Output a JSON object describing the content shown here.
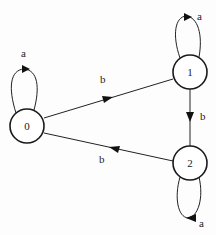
{
  "diagram": {
    "type": "finite-state-automaton",
    "background": "#ffffff",
    "stroke_color": "#1a1a1a",
    "nodes": [
      {
        "id": "0",
        "label": "0",
        "cx": 27,
        "cy": 126,
        "r": 17
      },
      {
        "id": "1",
        "label": "1",
        "cx": 190,
        "cy": 72,
        "r": 17
      },
      {
        "id": "2",
        "label": "2",
        "cx": 190,
        "cy": 163,
        "r": 17
      }
    ],
    "edges": [
      {
        "from": "0",
        "to": "0",
        "label": "a",
        "kind": "self-loop-top"
      },
      {
        "from": "0",
        "to": "1",
        "label": "b"
      },
      {
        "from": "1",
        "to": "1",
        "label": "a",
        "kind": "self-loop-top"
      },
      {
        "from": "1",
        "to": "2",
        "label": "b"
      },
      {
        "from": "2",
        "to": "2",
        "label": "a",
        "kind": "self-loop-bottom"
      },
      {
        "from": "2",
        "to": "0",
        "label": "b"
      }
    ]
  }
}
